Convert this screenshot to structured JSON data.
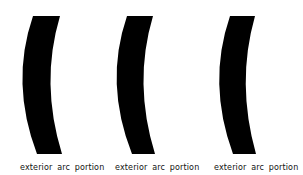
{
  "figure": {
    "background": "#ffffff",
    "arc_color": "#000000",
    "panels": [
      {
        "id": "panel-1",
        "label": "exterior arc portion",
        "arc": {
          "top_left": [
            33,
            16
          ],
          "top_right": [
            60,
            16
          ],
          "mid_left": [
            21,
            83
          ],
          "mid_right": [
            45,
            83
          ],
          "bottom_left": [
            37,
            154
          ],
          "bottom_right": [
            62,
            154
          ]
        },
        "label_x": 20
      },
      {
        "id": "panel-2",
        "label": "exterior arc portion",
        "arc": {
          "top_left": [
            127,
            16
          ],
          "top_right": [
            153,
            16
          ],
          "mid_left": [
            115,
            83
          ],
          "mid_right": [
            139,
            83
          ],
          "bottom_left": [
            132,
            154
          ],
          "bottom_right": [
            155,
            154
          ]
        },
        "label_x": 115
      },
      {
        "id": "panel-3",
        "label": "exterior arc portion",
        "arc": {
          "top_left": [
            230,
            16
          ],
          "top_right": [
            255,
            16
          ],
          "mid_left": [
            218,
            83
          ],
          "mid_right": [
            242,
            83
          ],
          "bottom_left": [
            233,
            154
          ],
          "bottom_right": [
            256,
            154
          ]
        },
        "label_x": 214
      }
    ]
  }
}
